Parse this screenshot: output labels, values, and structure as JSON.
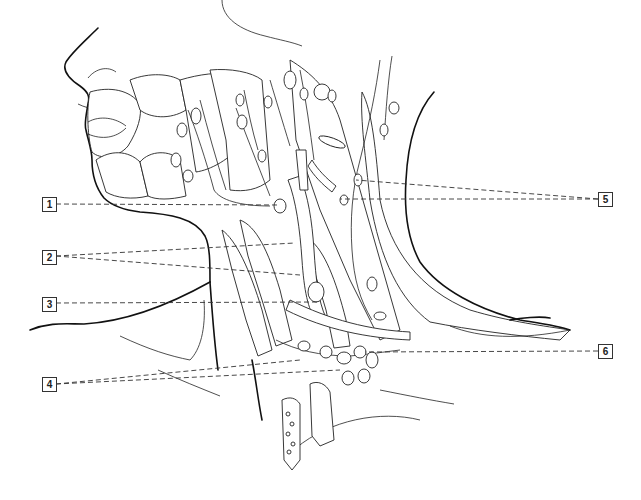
{
  "figure": {
    "style": "black-and-white line illustration",
    "colors": {
      "line": "#111111",
      "background": "#ffffff",
      "label_border": "#333333"
    }
  },
  "labels": [
    {
      "id": "1",
      "text": "1",
      "side": "left",
      "box": [
        42,
        197
      ],
      "targets": [
        [
          280,
          205
        ]
      ]
    },
    {
      "id": "2",
      "text": "2",
      "side": "left",
      "box": [
        42,
        250
      ],
      "targets": [
        [
          295,
          243
        ],
        [
          300,
          275
        ]
      ]
    },
    {
      "id": "3",
      "text": "3",
      "side": "left",
      "box": [
        42,
        297
      ],
      "targets": [
        [
          318,
          302
        ]
      ]
    },
    {
      "id": "4",
      "text": "4",
      "side": "left",
      "box": [
        42,
        377
      ],
      "targets": [
        [
          300,
          355
        ],
        [
          340,
          368
        ]
      ]
    },
    {
      "id": "5",
      "text": "5",
      "side": "right",
      "box": [
        598,
        192
      ],
      "targets": [
        [
          355,
          180
        ],
        [
          340,
          200
        ]
      ]
    },
    {
      "id": "6",
      "text": "6",
      "side": "right",
      "box": [
        598,
        344
      ],
      "targets": [
        [
          365,
          350
        ]
      ]
    }
  ]
}
